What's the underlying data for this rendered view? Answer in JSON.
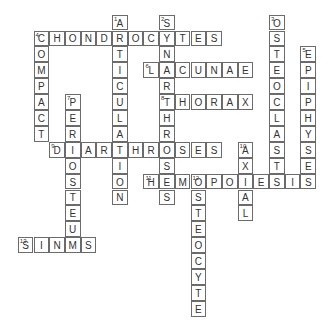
{
  "puzzle": {
    "grid": {
      "origin_x": 34,
      "origin_y": 31,
      "cell_w": 15.7,
      "cell_h": 15.9
    },
    "entries": [
      {
        "number": 1,
        "direction": "down",
        "answer": "ARTICULATION",
        "row": -1,
        "col": 5
      },
      {
        "number": 2,
        "direction": "down",
        "answer": "SYNARTHROSES",
        "row": -1,
        "col": 8
      },
      {
        "number": 3,
        "direction": "down",
        "answer": "OSTEOCLASTS",
        "row": -1,
        "col": 15
      },
      {
        "number": 4,
        "direction": "across",
        "answer": "CHONDROCYTES",
        "row": 0,
        "col": 0
      },
      {
        "number": 4,
        "direction": "down",
        "answer": "COMPACT",
        "row": 0,
        "col": 0
      },
      {
        "number": 5,
        "direction": "down",
        "answer": "EPIPHYSES",
        "row": 1,
        "col": 17
      },
      {
        "number": 6,
        "direction": "across",
        "answer": "LACUNAE",
        "row": 2,
        "col": 7
      },
      {
        "number": 7,
        "direction": "down",
        "answer": "PERIOSTEUM",
        "row": 4,
        "col": 2
      },
      {
        "number": 8,
        "direction": "across",
        "answer": "THORAX",
        "row": 4,
        "col": 8
      },
      {
        "number": 9,
        "direction": "across",
        "answer": "DIARTHROSES",
        "row": 7,
        "col": 1
      },
      {
        "number": 10,
        "direction": "down",
        "answer": "AXIAL",
        "row": 7,
        "col": 13
      },
      {
        "number": 11,
        "direction": "across",
        "answer": "HEMOPOIESIS",
        "row": 9,
        "col": 7
      },
      {
        "number": 12,
        "direction": "down",
        "answer": "OSTEOCYTE",
        "row": 9,
        "col": 10
      },
      {
        "number": 13,
        "direction": "across",
        "answer": "SINUS",
        "row": 13,
        "col": -1
      }
    ]
  }
}
